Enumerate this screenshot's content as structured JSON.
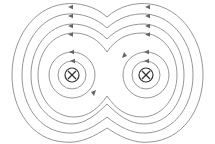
{
  "diagram": {
    "title": "",
    "colors": {
      "background": "#ffffff",
      "field_line": "#8a8a8a",
      "wire": "#333333",
      "arrow": "#666666"
    },
    "wires": [
      {
        "id": "left-wire",
        "cx": 72,
        "cy": 75,
        "r": 7,
        "symbol": "⊗",
        "current_direction": "into page"
      },
      {
        "id": "right-wire",
        "cx": 146,
        "cy": 75,
        "r": 7,
        "symbol": "⊗",
        "current_direction": "into page"
      }
    ],
    "inner_circle_radii": [
      14,
      23
    ],
    "enclosing_field_lines": 4,
    "field_direction": "clockwise"
  }
}
